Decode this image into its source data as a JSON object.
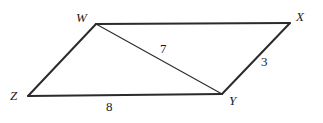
{
  "figure": {
    "kind": "parallelogram-with-diagonal",
    "stroke_color": "#2b2b2b",
    "background_color": "#ffffff",
    "vertices": [
      {
        "name": "W",
        "label": "W",
        "x": 96,
        "y": 24
      },
      {
        "name": "X",
        "label": "X",
        "x": 290,
        "y": 23
      },
      {
        "name": "Y",
        "label": "Y",
        "x": 222,
        "y": 94
      },
      {
        "name": "Z",
        "label": "Z",
        "x": 28,
        "y": 96
      }
    ],
    "edges": [
      {
        "name": "WX",
        "from": "W",
        "to": "X",
        "weight": "thick"
      },
      {
        "name": "XY",
        "from": "X",
        "to": "Y",
        "weight": "thick"
      },
      {
        "name": "YZ",
        "from": "Y",
        "to": "Z",
        "weight": "thick"
      },
      {
        "name": "ZW",
        "from": "Z",
        "to": "W",
        "weight": "thick"
      },
      {
        "name": "WY",
        "from": "W",
        "to": "Y",
        "weight": "thin"
      }
    ],
    "measures": [
      {
        "name": "diagonal-WY",
        "value": "7",
        "x": 160,
        "y": 42
      },
      {
        "name": "side-XY",
        "value": "3",
        "x": 261,
        "y": 55
      },
      {
        "name": "side-ZY",
        "value": "8",
        "x": 106,
        "y": 100
      }
    ]
  }
}
